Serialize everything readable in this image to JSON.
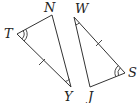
{
  "diagram": {
    "type": "congruent-triangles",
    "triangles": [
      {
        "name": "triangle-NTY",
        "vertices": [
          {
            "label": "N",
            "x": 52,
            "y": 15,
            "label_x": 44,
            "label_y": 12
          },
          {
            "label": "T",
            "x": 17,
            "y": 34,
            "label_x": 4,
            "label_y": 38
          },
          {
            "label": "Y",
            "x": 71,
            "y": 87,
            "label_x": 64,
            "label_y": 101
          }
        ],
        "marks": {
          "double_angle_at": "T",
          "single_angle_at": "Y",
          "tick_side": "TY"
        }
      },
      {
        "name": "triangle-WSJ",
        "vertices": [
          {
            "label": "W",
            "x": 74,
            "y": 17,
            "label_x": 75,
            "label_y": 13
          },
          {
            "label": "S",
            "x": 125,
            "y": 73,
            "label_x": 128,
            "label_y": 77
          },
          {
            "label": "J",
            "x": 90,
            "y": 87,
            "label_x": 88,
            "label_y": 101
          }
        ],
        "marks": {
          "double_angle_at": "S",
          "single_angle_at": "W",
          "tick_side": "WS"
        }
      }
    ],
    "stroke_color": "#333333",
    "background": "#ffffff"
  }
}
